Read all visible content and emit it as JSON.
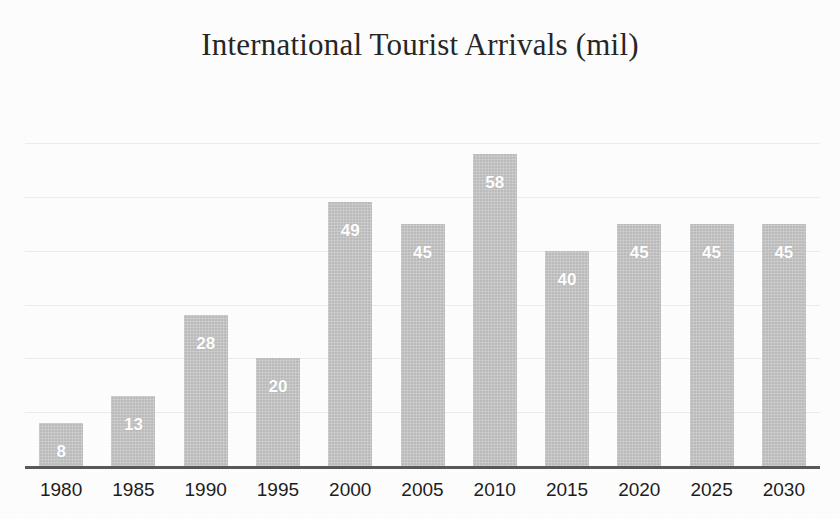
{
  "chart_data": {
    "type": "bar",
    "title": "International Tourist Arrivals (mil)",
    "xlabel": "",
    "ylabel": "",
    "ylim": [
      0,
      68
    ],
    "grid": true,
    "gridline_values": [
      10,
      20,
      30,
      40,
      50,
      60
    ],
    "legend": null,
    "legend_position": "none",
    "data_labels_shown": true,
    "categories": [
      "1980",
      "1985",
      "1990",
      "1995",
      "2000",
      "2005",
      "2010",
      "2015",
      "2020",
      "2025",
      "2030"
    ],
    "values": [
      8,
      13,
      28,
      20,
      49,
      45,
      58,
      40,
      45,
      45,
      45
    ],
    "labels": [
      "8",
      "13",
      "28",
      "20",
      "49",
      "45",
      "58",
      "40",
      "45",
      "45",
      "45"
    ]
  },
  "style": {
    "bar_color": "#c2c2c2",
    "data_label_color": "#ffffff",
    "axis_color": "#595959",
    "gridline_color": "#ececed",
    "title_color": "#262626",
    "tick_label_color": "#1d1d1d",
    "background_color": "#fdfdfd"
  }
}
